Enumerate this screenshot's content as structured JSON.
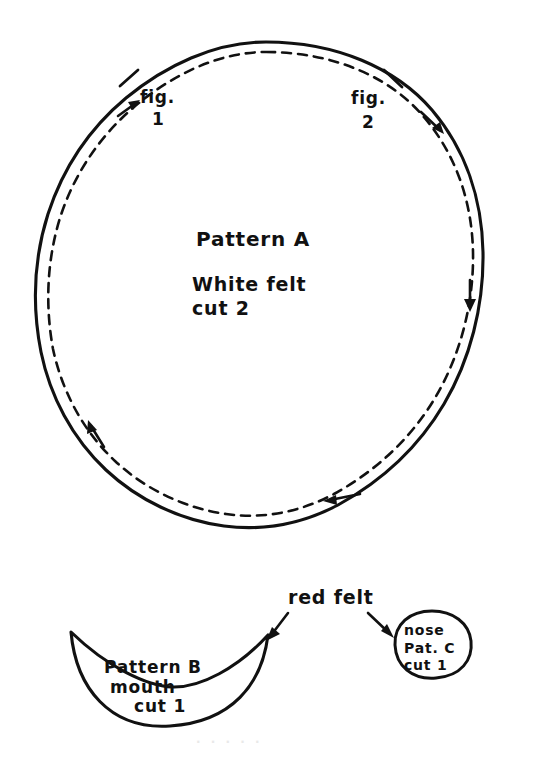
{
  "document": {
    "type": "hand-drawn sewing pattern sheet",
    "background_color": "#ffffff",
    "ink_color": "#111111",
    "width": 534,
    "height": 762
  },
  "pattern_a": {
    "name": "pattern-a-circle",
    "title": "Pattern A",
    "material": "White felt",
    "quantity": "cut 2",
    "shape": "circle",
    "notch_labels": [
      {
        "id": "fig2",
        "line1": "fig.",
        "line2": "2"
      },
      {
        "id": "fig1",
        "line1": "fig.",
        "line2": "1"
      }
    ],
    "seam_line_style": "dashed",
    "cut_line_style": "solid"
  },
  "pattern_b": {
    "name": "pattern-b-mouth",
    "title": "Pattern B",
    "part": "mouth",
    "quantity": "cut 1",
    "shape": "crescent"
  },
  "pattern_c": {
    "name": "pattern-c-nose",
    "part": "nose",
    "title": "Pat. C",
    "quantity": "cut 1",
    "shape": "oval"
  },
  "annotations": {
    "red_felt_label": "red felt",
    "arrow_targets": [
      "pattern-b-mouth",
      "pattern-c-nose"
    ]
  },
  "ghost_text": {
    "bottom_bleed": "· · · · ·"
  }
}
